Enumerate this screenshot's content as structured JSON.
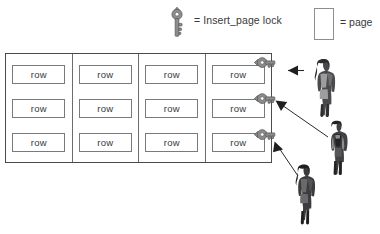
{
  "legend": {
    "key": {
      "icon": "key-icon",
      "label": "= Insert_page lock"
    },
    "page": {
      "icon": "page-rectangle-icon",
      "label": "= page"
    }
  },
  "diagram": {
    "row_label": "row",
    "pages": [
      {
        "name": "page-1",
        "rows": [
          "row",
          "row",
          "row"
        ],
        "locked": false
      },
      {
        "name": "page-2",
        "rows": [
          "row",
          "row",
          "row"
        ],
        "locked": false
      },
      {
        "name": "page-3",
        "rows": [
          "row",
          "row",
          "row"
        ],
        "locked": false
      },
      {
        "name": "page-4",
        "rows": [
          "row",
          "row",
          "row"
        ],
        "locked": true
      }
    ],
    "locks": [
      {
        "name": "insert-page-lock-1",
        "row_index": 0
      },
      {
        "name": "insert-page-lock-2",
        "row_index": 1
      },
      {
        "name": "insert-page-lock-3",
        "row_index": 2
      }
    ],
    "users": [
      {
        "name": "user-1"
      },
      {
        "name": "user-2"
      },
      {
        "name": "user-3"
      }
    ]
  },
  "colors": {
    "key_fill": "#8c8c8e",
    "key_stroke": "#5a5a5c",
    "table_border": "#4b4b4d",
    "row_border": "#7a7a7d",
    "text": "#39393b",
    "background": "#ffffff",
    "arrow": "#2b2b2d"
  }
}
